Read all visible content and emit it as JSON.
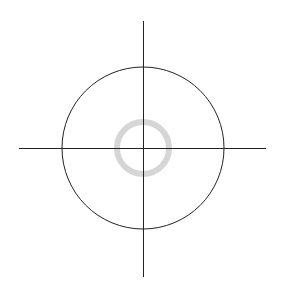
{
  "canvas": {
    "width": 286,
    "height": 298,
    "background": "#ffffff"
  },
  "diagram": {
    "vertical_axis": {
      "x": 143,
      "y1": 21,
      "y2": 277,
      "color": "#222222"
    },
    "horizontal_axis": {
      "y": 148,
      "x1": 19,
      "x2": 266,
      "color": "#222222"
    },
    "outer_circle": {
      "cx": 143,
      "cy": 148,
      "r": 81,
      "color": "#222222"
    },
    "inner_ring": {
      "cx": 143,
      "cy": 148,
      "r": 26,
      "stroke_width": 6,
      "color": "#d6d6d6"
    }
  }
}
